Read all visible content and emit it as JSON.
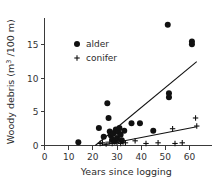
{
  "chart_data": {
    "type": "scatter",
    "title": "",
    "xlabel": "Years since logging",
    "ylabel": "Woody debris (m³ /100 m)",
    "ylabel_main": "Woody debris (m",
    "ylabel_sup": "3",
    "ylabel_tail": " /100 m)",
    "xlim": [
      0,
      66
    ],
    "ylim": [
      0,
      19
    ],
    "xticks": [
      0,
      10,
      20,
      30,
      40,
      50,
      60
    ],
    "xtick_labels": [
      "0",
      "10",
      "20",
      "30",
      "40",
      "50",
      "60"
    ],
    "yticks": [
      0,
      5,
      10,
      15
    ],
    "ytick_labels": [
      "0",
      "5",
      "10",
      "15"
    ],
    "grid": false,
    "legend_position": "upper-left-inside",
    "legend": [
      {
        "name": "alder",
        "marker": "filled-circle"
      },
      {
        "name": "conifer",
        "marker": "plus"
      }
    ],
    "series": [
      {
        "name": "alder",
        "marker": "filled-circle",
        "color": "#111111",
        "points": [
          [
            14.0,
            0.5
          ],
          [
            22.5,
            2.6
          ],
          [
            24.5,
            1.3
          ],
          [
            26.0,
            6.3
          ],
          [
            26.5,
            4.1
          ],
          [
            27.0,
            2.1
          ],
          [
            27.5,
            1.5
          ],
          [
            28.0,
            0.9
          ],
          [
            28.5,
            1.8
          ],
          [
            29.0,
            0.6
          ],
          [
            29.5,
            2.4
          ],
          [
            30.0,
            1.1
          ],
          [
            30.5,
            2.0
          ],
          [
            31.0,
            2.6
          ],
          [
            31.5,
            1.6
          ],
          [
            32.0,
            0.8
          ],
          [
            33.0,
            2.2
          ],
          [
            36.0,
            3.3
          ],
          [
            39.5,
            3.3
          ],
          [
            45.0,
            2.2
          ],
          [
            51.0,
            18.0
          ],
          [
            51.5,
            7.8
          ],
          [
            51.5,
            7.2
          ],
          [
            61.0,
            15.5
          ],
          [
            61.0,
            15.1
          ]
        ]
      },
      {
        "name": "conifer",
        "marker": "plus",
        "color": "#111111",
        "points": [
          [
            23.0,
            0.3
          ],
          [
            24.0,
            0.4
          ],
          [
            25.5,
            0.2
          ],
          [
            27.0,
            0.5
          ],
          [
            28.0,
            0.3
          ],
          [
            29.0,
            0.6
          ],
          [
            30.0,
            0.4
          ],
          [
            30.5,
            0.7
          ],
          [
            31.5,
            0.3
          ],
          [
            32.5,
            0.5
          ],
          [
            33.5,
            0.4
          ],
          [
            37.5,
            0.7
          ],
          [
            42.0,
            0.3
          ],
          [
            47.0,
            0.4
          ],
          [
            53.0,
            2.5
          ],
          [
            54.0,
            0.3
          ],
          [
            57.0,
            0.4
          ],
          [
            62.5,
            4.1
          ],
          [
            63.0,
            2.9
          ]
        ]
      }
    ],
    "fit_lines": [
      {
        "name": "alder-fit",
        "x": [
          21.0,
          63.0
        ],
        "y": [
          0.0,
          12.5
        ]
      },
      {
        "name": "conifer-fit",
        "x": [
          23.0,
          63.0
        ],
        "y": [
          0.0,
          2.8
        ]
      }
    ]
  }
}
